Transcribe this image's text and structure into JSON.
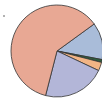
{
  "chart_data": {
    "type": "pie",
    "title": "",
    "labels": [
      "Slice A",
      "Slice B",
      "Slice C",
      "Slice D",
      "Slice E"
    ],
    "values": [
      61,
      13,
      1,
      3,
      22
    ],
    "colors": [
      "#e8a894",
      "#a9bcd9",
      "#2f5f3f",
      "#f2b585",
      "#b3b6d8"
    ],
    "start_angle_deg": -36,
    "center": [
      57,
      51
    ],
    "radius": 46,
    "edge_color": "#333333"
  }
}
